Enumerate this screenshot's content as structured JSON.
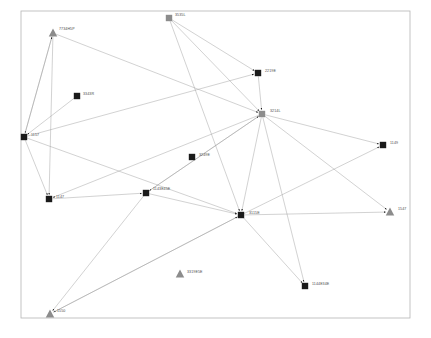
{
  "canvas": {
    "width": 431,
    "height": 338,
    "background_color": "#ffffff",
    "frame": {
      "x": 21,
      "y": 11,
      "width": 389,
      "height": 307,
      "stroke_color": "#b5b5b5"
    }
  },
  "graph": {
    "type": "directed-network-diagram",
    "edge_color": "#9b9b9b",
    "label_color": "#4a4a4a",
    "dark_node_color": "#1a1a1a",
    "gray_node_color": "#8c8c8c",
    "nodes": [
      {
        "id": "n1",
        "label": "7734H5P",
        "x": 53,
        "y": 33,
        "shape": "triangle",
        "color": "#8c8c8c",
        "label_dx": 6,
        "label_dy": -3
      },
      {
        "id": "n2",
        "label": "3535L",
        "x": 169,
        "y": 18,
        "shape": "square",
        "color": "#8c8c8c",
        "label_dx": 6,
        "label_dy": -2
      },
      {
        "id": "n3",
        "label": "3343R",
        "x": 77,
        "y": 96,
        "shape": "square",
        "color": "#1a1a1a",
        "label_dx": 6,
        "label_dy": -1
      },
      {
        "id": "n4",
        "label": "2219E",
        "x": 258,
        "y": 73,
        "shape": "square",
        "color": "#1a1a1a",
        "label_dx": 7,
        "label_dy": -1
      },
      {
        "id": "n5",
        "label": "3214L",
        "x": 262,
        "y": 114,
        "shape": "square",
        "color": "#8c8c8c",
        "label_dx": 8,
        "label_dy": -2
      },
      {
        "id": "n6",
        "label": "1157",
        "x": 24,
        "y": 137,
        "shape": "square",
        "color": "#1a1a1a",
        "label_dx": 7,
        "label_dy": -1
      },
      {
        "id": "n7",
        "label": "3249E",
        "x": 192,
        "y": 157,
        "shape": "square",
        "color": "#1a1a1a",
        "label_dx": 7,
        "label_dy": -1
      },
      {
        "id": "n8",
        "label": "1149",
        "x": 383,
        "y": 145,
        "shape": "square",
        "color": "#1a1a1a",
        "label_dx": 7,
        "label_dy": -1
      },
      {
        "id": "n9",
        "label": "1143E45E",
        "x": 146,
        "y": 193,
        "shape": "square",
        "color": "#1a1a1a",
        "label_dx": 7,
        "label_dy": -3
      },
      {
        "id": "n10",
        "label": "1147",
        "x": 49,
        "y": 199,
        "shape": "square",
        "color": "#1a1a1a",
        "label_dx": 7,
        "label_dy": -1
      },
      {
        "id": "n11",
        "label": "3115E",
        "x": 241,
        "y": 215,
        "shape": "square",
        "color": "#1a1a1a",
        "label_dx": 8,
        "label_dy": -1
      },
      {
        "id": "n12",
        "label": "1547",
        "x": 390,
        "y": 212,
        "shape": "triangle",
        "color": "#8c8c8c",
        "label_dx": 8,
        "label_dy": -2
      },
      {
        "id": "n13",
        "label": "3319E5E",
        "x": 180,
        "y": 274,
        "shape": "triangle",
        "color": "#8c8c8c",
        "label_dx": 7,
        "label_dy": -1
      },
      {
        "id": "n14",
        "label": "1144E34E",
        "x": 305,
        "y": 286,
        "shape": "square",
        "color": "#1a1a1a",
        "label_dx": 7,
        "label_dy": -1
      },
      {
        "id": "n15",
        "label": "1550",
        "x": 50,
        "y": 314,
        "shape": "triangle",
        "color": "#8c8c8c",
        "label_dx": 7,
        "label_dy": -2
      }
    ],
    "edges": [
      {
        "from": "n1",
        "to": "n6"
      },
      {
        "from": "n1",
        "to": "n10"
      },
      {
        "from": "n1",
        "to": "n5"
      },
      {
        "from": "n2",
        "to": "n4"
      },
      {
        "from": "n2",
        "to": "n5"
      },
      {
        "from": "n2",
        "to": "n11"
      },
      {
        "from": "n3",
        "to": "n6"
      },
      {
        "from": "n4",
        "to": "n5"
      },
      {
        "from": "n6",
        "to": "n1"
      },
      {
        "from": "n6",
        "to": "n4"
      },
      {
        "from": "n6",
        "to": "n10"
      },
      {
        "from": "n6",
        "to": "n11"
      },
      {
        "from": "n5",
        "to": "n8"
      },
      {
        "from": "n5",
        "to": "n11"
      },
      {
        "from": "n5",
        "to": "n9"
      },
      {
        "from": "n5",
        "to": "n10"
      },
      {
        "from": "n5",
        "to": "n14"
      },
      {
        "from": "n5",
        "to": "n12"
      },
      {
        "from": "n9",
        "to": "n5"
      },
      {
        "from": "n9",
        "to": "n11"
      },
      {
        "from": "n9",
        "to": "n15"
      },
      {
        "from": "n10",
        "to": "n9"
      },
      {
        "from": "n11",
        "to": "n12"
      },
      {
        "from": "n11",
        "to": "n14"
      },
      {
        "from": "n11",
        "to": "n15"
      },
      {
        "from": "n11",
        "to": "n8"
      },
      {
        "from": "n15",
        "to": "n11"
      }
    ]
  }
}
